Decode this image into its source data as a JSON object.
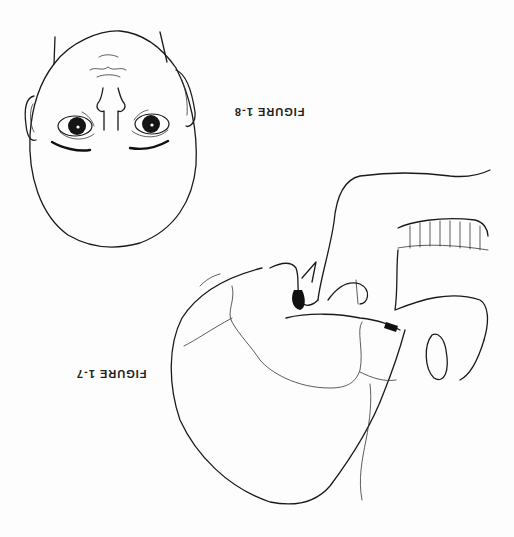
{
  "page": {
    "orientation": "rotated 180 degrees",
    "figures": [
      {
        "id": "fig-1-8",
        "caption": "FIGURE 1-8",
        "subject": "face drawing (upside down)"
      },
      {
        "id": "fig-1-7",
        "caption": "FIGURE 1-7",
        "subject": "skull lateral view (upside down)"
      }
    ]
  },
  "colors": {
    "ink": "#1a1a1a",
    "paper": "#fdfdfd"
  }
}
